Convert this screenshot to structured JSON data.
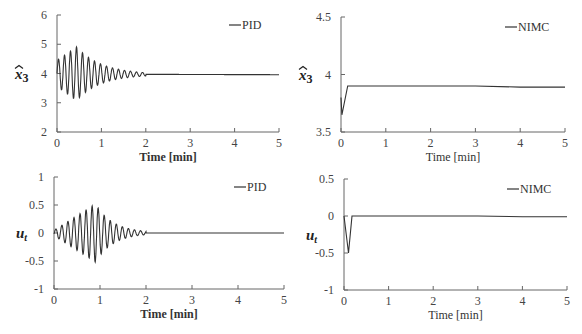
{
  "chart_data": [
    {
      "id": "tl",
      "type": "line",
      "title": "",
      "xlabel": "Time [min]",
      "xlabel_bold": true,
      "ylabel": "x̂3",
      "xlim": [
        0,
        5
      ],
      "ylim": [
        2,
        6
      ],
      "xticks": [
        "0",
        "1",
        "2",
        "3",
        "4",
        "5"
      ],
      "yticks": [
        "2",
        "3",
        "4",
        "5",
        "6"
      ],
      "grid": false,
      "legend": {
        "position": "top-right",
        "entries": [
          "PID"
        ]
      },
      "series": [
        {
          "name": "PID",
          "description": "damped oscillation around 4, amplitude ~0.9 at t≈0.3-0.5 min, decays and settles to ~3.97 by t≈2 min",
          "x": [
            0,
            0.3,
            0.45,
            1.0,
            1.5,
            2.0,
            5.0
          ],
          "y": [
            4.0,
            4.9,
            4.95,
            4.5,
            4.05,
            3.97,
            3.96
          ]
        }
      ],
      "frame": {
        "x0": 57,
        "x1": 279,
        "y0": 132,
        "y1": 15
      }
    },
    {
      "id": "tr",
      "type": "line",
      "title": "",
      "xlabel": "Time [min]",
      "xlabel_bold": false,
      "ylabel": "x̂3",
      "xlim": [
        0,
        5
      ],
      "ylim": [
        3.5,
        4.5
      ],
      "xticks": [
        "0",
        "1",
        "2",
        "3",
        "4",
        "5"
      ],
      "yticks": [
        "3.5",
        "4",
        "4.5"
      ],
      "grid": false,
      "legend": {
        "position": "top-right",
        "entries": [
          "NIMC"
        ]
      },
      "series": [
        {
          "name": "NIMC",
          "x": [
            0,
            0.02,
            0.15,
            1,
            2,
            3,
            4,
            5
          ],
          "y": [
            3.8,
            3.65,
            3.9,
            3.9,
            3.9,
            3.9,
            3.89,
            3.89
          ]
        }
      ],
      "frame": {
        "x0": 341,
        "x1": 565,
        "y0": 132,
        "y1": 17
      }
    },
    {
      "id": "bl",
      "type": "line",
      "title": "",
      "xlabel": "Time [min]",
      "xlabel_bold": true,
      "ylabel": "ut",
      "xlim": [
        0,
        5
      ],
      "ylim": [
        -1,
        1
      ],
      "xticks": [
        "0",
        "1",
        "2",
        "3",
        "4",
        "5"
      ],
      "yticks": [
        "-1",
        "-0.5",
        "0",
        "0.5",
        "1"
      ],
      "grid": false,
      "legend": {
        "position": "top-right",
        "entries": [
          "PID"
        ]
      },
      "series": [
        {
          "name": "PID",
          "description": "oscillation around 0, envelope grows to ±0.5 at t≈0.8-1.1 min then decays to 0 by t≈2 min",
          "x": [
            0,
            0.3,
            0.8,
            1.1,
            1.5,
            2.0,
            5.0
          ],
          "y": [
            0,
            0.2,
            -0.55,
            0.45,
            0.15,
            0.0,
            0.0
          ]
        }
      ],
      "frame": {
        "x0": 54,
        "x1": 284,
        "y0": 289,
        "y1": 177
      }
    },
    {
      "id": "br",
      "type": "line",
      "title": "",
      "xlabel": "Time [min]",
      "xlabel_bold": false,
      "ylabel": "ut",
      "xlim": [
        0,
        5
      ],
      "ylim": [
        -1,
        0.5
      ],
      "xticks": [
        "0",
        "1",
        "2",
        "3",
        "4",
        "5"
      ],
      "yticks": [
        "-1",
        "-0.5",
        "0",
        "0.5"
      ],
      "grid": false,
      "legend": {
        "position": "top-right",
        "entries": [
          "NIMC"
        ]
      },
      "series": [
        {
          "name": "NIMC",
          "x": [
            0,
            0.1,
            0.18,
            1,
            2,
            3,
            4,
            5
          ],
          "y": [
            0,
            -0.5,
            0.0,
            0.0,
            0.0,
            0.0,
            -0.01,
            -0.01
          ]
        }
      ],
      "frame": {
        "x0": 344,
        "x1": 567,
        "y0": 290,
        "y1": 179
      }
    }
  ]
}
